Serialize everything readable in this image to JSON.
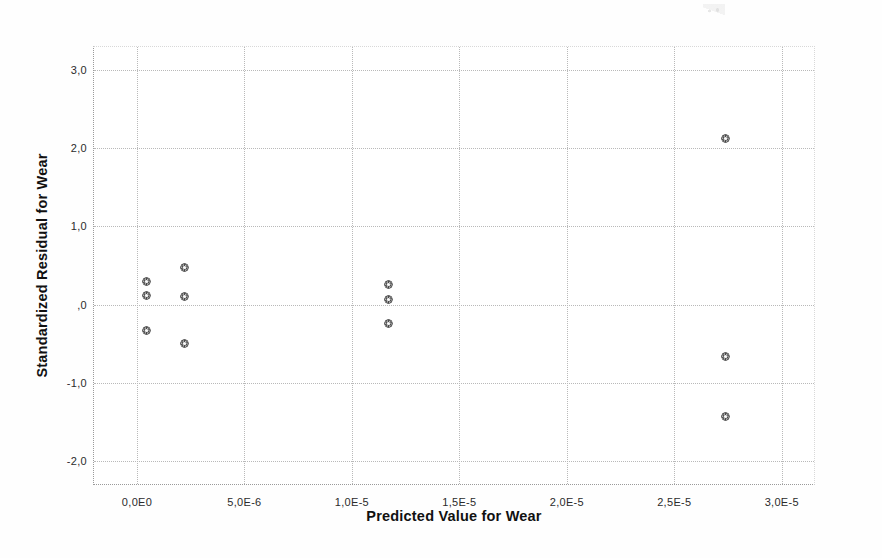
{
  "chart_data": {
    "type": "scatter",
    "title": "",
    "xlabel": "Predicted Value for Wear",
    "ylabel": "Standardized Residual for Wear",
    "xlim": [
      -2e-06,
      3.15e-05
    ],
    "ylim": [
      -2.3,
      3.3
    ],
    "grid": true,
    "legend": "none",
    "marker": "dotted-circle",
    "marker_color": "#3b3b3b",
    "xticks": [
      0.0,
      5e-06,
      1e-05,
      1.5e-05,
      2e-05,
      2.5e-05,
      3e-05
    ],
    "xtick_labels": [
      "0,0E0",
      "5,0E-6",
      "1,0E-5",
      "1,5E-5",
      "2,0E-5",
      "2,5E-5",
      "3,0E-5"
    ],
    "yticks": [
      3.0,
      2.0,
      1.0,
      0.0,
      -1.0,
      -2.0
    ],
    "ytick_labels": [
      "3,0",
      "2,0",
      "1,0",
      ",0",
      "-1,0",
      "-2,0"
    ],
    "points": [
      {
        "x": 4.5e-07,
        "y": 0.29
      },
      {
        "x": 4.5e-07,
        "y": 0.11
      },
      {
        "x": 4.5e-07,
        "y": -0.33
      },
      {
        "x": 2.2e-06,
        "y": 0.47
      },
      {
        "x": 2.2e-06,
        "y": 0.1
      },
      {
        "x": 2.2e-06,
        "y": -0.5
      },
      {
        "x": 1.17e-05,
        "y": 0.26
      },
      {
        "x": 1.17e-05,
        "y": 0.07
      },
      {
        "x": 1.17e-05,
        "y": -0.24
      },
      {
        "x": 2.74e-05,
        "y": 2.13
      },
      {
        "x": 2.74e-05,
        "y": -0.66
      },
      {
        "x": 2.74e-05,
        "y": -1.44
      }
    ],
    "n_points": 12
  },
  "axes": {
    "x_title": "Predicted Value for Wear",
    "y_title": "Standardized Residual for Wear"
  },
  "colors": {
    "background": "#ffffff",
    "grid": "#b9b9b9",
    "axis": "#9a9a9a",
    "marker": "#3b3b3b",
    "text": "#1a1a1a"
  }
}
